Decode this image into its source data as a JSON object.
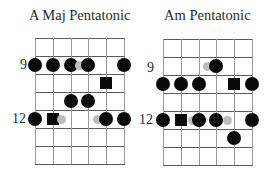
{
  "diagrams": [
    {
      "title": "A Maj Pentatonic",
      "title_x": 29,
      "origin_x": 35,
      "origin_y": 38,
      "fret_labels": [
        {
          "text": "9",
          "x": 20,
          "y": 58
        },
        {
          "text": "12",
          "x": 12,
          "y": 112
        }
      ],
      "markers": [
        {
          "type": "circle",
          "string": 1,
          "space": 2
        },
        {
          "type": "circle",
          "string": 2,
          "space": 2
        },
        {
          "type": "circle",
          "string": 3,
          "space": 2
        },
        {
          "type": "ghost",
          "x_offset": 44,
          "space": 2
        },
        {
          "type": "circle",
          "string": 4,
          "space": 2
        },
        {
          "type": "circle",
          "string": 6,
          "space": 2
        },
        {
          "type": "square",
          "string": 5,
          "space": 3
        },
        {
          "type": "circle",
          "string": 3,
          "space": 4
        },
        {
          "type": "circle",
          "string": 4,
          "space": 4
        },
        {
          "type": "circle",
          "string": 1,
          "space": 5
        },
        {
          "type": "square",
          "string": 2,
          "space": 5
        },
        {
          "type": "ghost",
          "x_offset": 26,
          "space": 5
        },
        {
          "type": "ghost",
          "x_offset": 62,
          "space": 5
        },
        {
          "type": "circle",
          "string": 5,
          "space": 5
        },
        {
          "type": "circle",
          "string": 6,
          "space": 5
        }
      ]
    },
    {
      "title": "Am Pentatonic",
      "title_x": 164,
      "origin_x": 163,
      "origin_y": 39,
      "fret_labels": [
        {
          "text": "9",
          "x": 147,
          "y": 61
        },
        {
          "text": "12",
          "x": 139,
          "y": 113
        }
      ],
      "markers": [
        {
          "type": "ghost",
          "x_offset": 44,
          "space": 2
        },
        {
          "type": "circle",
          "string": 4,
          "space": 2
        },
        {
          "type": "circle",
          "string": 1,
          "space": 3
        },
        {
          "type": "circle",
          "string": 2,
          "space": 3
        },
        {
          "type": "circle",
          "string": 3,
          "space": 3
        },
        {
          "type": "square",
          "string": 5,
          "space": 3
        },
        {
          "type": "circle",
          "string": 6,
          "space": 3
        },
        {
          "type": "circle",
          "string": 1,
          "space": 5
        },
        {
          "type": "square",
          "string": 2,
          "space": 5
        },
        {
          "type": "ghost",
          "x_offset": 29,
          "space": 5
        },
        {
          "type": "circle",
          "string": 3,
          "space": 5
        },
        {
          "type": "circle",
          "string": 4,
          "space": 5
        },
        {
          "type": "ghost",
          "x_offset": 64,
          "space": 5
        },
        {
          "type": "circle",
          "string": 6,
          "space": 5
        },
        {
          "type": "circle",
          "string": 5,
          "space": 6
        }
      ]
    }
  ],
  "grid": {
    "strings": 6,
    "string_spacing": 17.8,
    "fret_lines": 8,
    "fret_spacing": 18,
    "line_color": "#5a5a5a",
    "string_color": "#9a9a9a"
  },
  "colors": {
    "marker": "#0a0a0a",
    "ghost": "#bdbdbd"
  }
}
